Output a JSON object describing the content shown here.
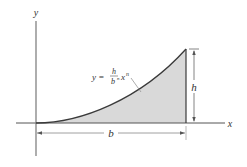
{
  "diagram": {
    "type": "area-under-curve",
    "axes": {
      "x_label": "x",
      "y_label": "y"
    },
    "curve": {
      "equation_lhs": "y =",
      "equation_numerator": "h",
      "equation_denominator": "b",
      "equation_denominator_exponent": "n",
      "equation_variable": "x",
      "equation_exponent": "n",
      "equation_text": "y = (h / b^n) x^n"
    },
    "dimensions": {
      "width_label": "b",
      "height_label": "h"
    },
    "colors": {
      "line": "#3a3a3a",
      "axis": "#555555",
      "shade": "#d9d9d9",
      "dimension": "#666666",
      "text": "#333333"
    }
  }
}
